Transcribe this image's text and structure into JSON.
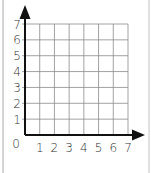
{
  "chart_data": {
    "type": "scatter",
    "title": "",
    "xlabel": "",
    "ylabel": "",
    "origin_label": "0",
    "x_ticks": [
      "1",
      "2",
      "3",
      "4",
      "5",
      "6",
      "7"
    ],
    "y_ticks": [
      "1",
      "2",
      "3",
      "4",
      "5",
      "6",
      "7"
    ],
    "xlim": [
      0,
      7
    ],
    "ylim": [
      0,
      7
    ],
    "grid": true,
    "series": [],
    "axis_arrows": true
  },
  "colors": {
    "axis": "#111111",
    "grid": "#8a8a8a",
    "frame": "#d4d4d4"
  }
}
